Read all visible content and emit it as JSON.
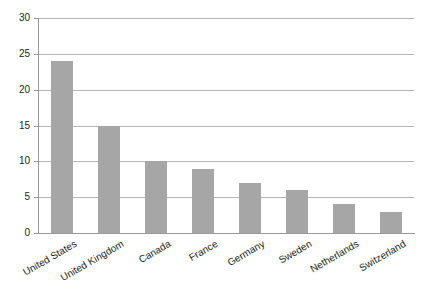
{
  "chart_data": {
    "type": "bar",
    "title": "",
    "subtitle": "",
    "xlabel": "",
    "ylabel": "",
    "categories": [
      "United States",
      "United Kingdom",
      "Canada",
      "France",
      "Germany",
      "Sweden",
      "Netherlands",
      "Switzerland"
    ],
    "values": [
      24,
      15,
      10,
      9,
      7,
      6,
      4,
      3
    ],
    "ylim": [
      0,
      30
    ],
    "yticks": [
      0,
      5,
      10,
      15,
      20,
      25,
      30
    ],
    "ytick_labels": [
      "0",
      "5",
      "10",
      "15",
      "20",
      "25",
      "30"
    ],
    "grid": true,
    "grid_axis": "y",
    "legend": false,
    "legend_position": "none",
    "bar_color": "#a6a6a6",
    "gridline_color": "#b4b4b4",
    "axis_color": "#9a9a9a",
    "text_color": "#231f20",
    "background_color": "#ffffff",
    "xtick_label_rotation": -30
  }
}
